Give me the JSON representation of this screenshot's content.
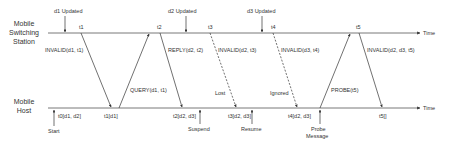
{
  "diagram": {
    "lines": {
      "station": {
        "label_line1": "Mobile",
        "label_line2": "Switching",
        "label_line3": "Station"
      },
      "host": {
        "label_line1": "Mobile",
        "label_line2": "Host"
      },
      "time_label": "Time"
    },
    "station_events": [
      {
        "label": "d1 Updated",
        "main": "d",
        "sub": "1",
        "rest": " Updated"
      },
      {
        "label": "d2 Updated",
        "main": "d",
        "sub": "2",
        "rest": " Updated"
      },
      {
        "label": "d3 Updated",
        "main": "d",
        "sub": "3",
        "rest": " Updated"
      }
    ],
    "station_ticks": [
      "t1",
      "t2",
      "t3",
      "t4",
      "t5"
    ],
    "messages": [
      {
        "label": "INVALID(d1, t1)"
      },
      {
        "label": "QUERY(d1, t1)"
      },
      {
        "label": "REPLY(d2, t2)"
      },
      {
        "label": "INVALID(d2, t3)"
      },
      {
        "label": "INVALID(d3, t4)"
      },
      {
        "label": "PROBE(t5)"
      },
      {
        "label": "INVALID(d2, d3, t5)"
      }
    ],
    "message_annotations": {
      "lost": "Lost",
      "ignored": "Ignored"
    },
    "host_states": [
      "t0[d1, d2]",
      "t1[d1]",
      "t2[d2, d3]",
      "t3[d2, d3]",
      "t4[d2, d3]",
      "t5[]"
    ],
    "host_events": {
      "start": "Start",
      "suspend": "Suspend",
      "resume": "Resume",
      "probe_line1": "Probe",
      "probe_line2": "Message"
    }
  }
}
